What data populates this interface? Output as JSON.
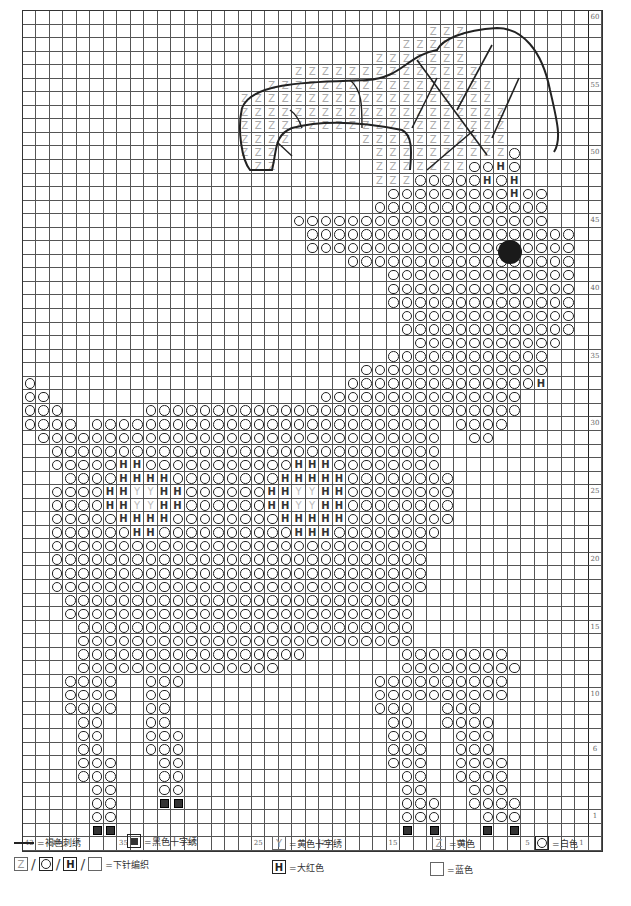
{
  "chart_data": {
    "type": "knitting-chart",
    "title": "",
    "columns": 43,
    "rows": 60,
    "column_labels": {
      "0": "42",
      "2": "40",
      "7": "35",
      "12": "30",
      "17": "25",
      "22": "20",
      "27": "15",
      "32": "10",
      "37": "5",
      "41": "1"
    },
    "row_labels": {
      "60": "60",
      "55": "55",
      "50": "50",
      "45": "45",
      "40": "40",
      "35": "35",
      "30": "30",
      "25": "25",
      "20": "20",
      "15": "15",
      "10": "10",
      "6": "6",
      "1": "1"
    },
    "symbols": {
      "O": "white",
      "H": "bright red",
      "Y": "yellow cross-stitch",
      "Z": "yellow",
      "X": "black cross-stitch",
      ".": "blue (background)"
    },
    "grid_top_to_bottom": [
      "...........................................",
      "..............................ZZZ..........",
      "............................ZZZZZ..........",
      "..........................ZZZZZZZ..........",
      "....................ZZZZZZZZZZZZZZ.........",
      "..................ZZZZZZZZZZZZZZZZZ........",
      "................ZZZZZZZZZZZZZZZZZZZ........",
      "................ZZZZZZZZZZZZZZZZZZZZ.......",
      "................ZZZZZZZZZZZZZZZZZZZZ.......",
      "................ZZZZ.....ZZZZZZZZZZZ.......",
      "................ZZZ.......ZZZZZZZZZZO......",
      ".................ZZ.......ZZZZZZZOOHO......",
      "..........................ZZZOOOOOHOH......",
      "...........................OOOOOOOOOHOO....",
      "..........................OOOOOOOOOOOOO....",
      "....................OOOOOOOOOOOOOOOOOOO....",
      ".....................OOOOOOOOOOOOOOOOOOOO..",
      ".....................OOOOOOOOOOOOOOOOOOOO..",
      "........................OOOOOOOOOOOOOOOOO..",
      "...........................OOOOOOOOOOOOOO..",
      "...........................OOOOOOOOOOOOOO..",
      "...........................OOOOOOOOOOOOOO..",
      "............................OOOOOOOOOOOOO..",
      "............................OOOOOOOOOOOOO..",
      ".............................OOOOOOOOOOO...",
      "...........................OOOOOOOOOOOO....",
      ".........................OOOOOOOOOOOOOO....",
      "O.......................OOOOOOOOOOOOOOH....",
      "OO....................OOOOOOOOOOOOOOO......",
      "OOO......OOOOOOOOOOOOOOOOOOOOOOOOOOOO......",
      "OOOO.OOOOOOOOOOOOOOOOOOOOOOOOOO.OOOO.......",
      ".OOOOOOOOOOOOOOOOOOOOOOOOOOOOOO..OO........",
      "..OOOOOOOOOOOOOOOOOOOOOOOOOOOOO............",
      "..OOOOOHHOOOOOOOOOOOHHHOOOOOOOO............",
      "...OOOOHHHHOOOOOOOOHHHHHOOOOOOOO...........",
      "..OOOOHHYYHHOOOOOOHHYYHHOOOOOOOO...........",
      "..OOOOHHYYHHOOOOOOHHYYHHOOOOOOOO...........",
      "..OOOOOHHHHOOOOOOOOHHHHHOOOOOOOO...........",
      "..OOOOOOHHOOOOOOOOOOHHHOOOOOOOO............",
      "..OOOOOOOOOOOOOOOOOOOOOOOOOOOO.............",
      "..OOOOOOOOOOOOOOOOOOOOOOOOOOOO.............",
      "..OOOOOOOOOOOOOOOOOOOOOOOOOOOO.............",
      "..OOOOOOOOOOOOOOOOOOOOOOOOOOOO.............",
      "...OOOOOOOOOOOOOOOOOOOOOOOOOO..............",
      "...OOOOOOOOOOOOOOOOOOOOOOOOOO..............",
      "....OOOOOOOOOOOOOOOOOOOOOOOOO..............",
      "....OOOOOOOOOOOOOOOOOOOOOOOOO..............",
      "....OOOOOOOOOOOOOOOOO.......OOOOOOOO.......",
      "....OOOOOOOOOOOOOOO.........OOOOOOOOO......",
      "...OOOO..OOO..............OOOOOOOOOO.......",
      "...OOOO..OO...............OOOOOOOOOO.......",
      "...OOOO..OO...............OOO..OOO.........",
      "....OO...OO................OO..OOOO........",
      "....OO...OOO...............OOO..OOO........",
      "....OO...OOO...............OOO..OOO........",
      "....OOO...OO...............OOO..OOOO.......",
      "....OOO...OO................OO..OOOO.......",
      ".....OO...OO................OO...OOO.......",
      ".....OO...XX................OOO..OOOO......",
      ".....OO.....................OOO...OOO......",
      ".....XX.....................X.X...X.X......"
    ]
  },
  "legend": {
    "row1": [
      {
        "symbol": "line",
        "label": "=褐色刺绣"
      },
      {
        "symbol": "X",
        "label": "=黑色十字绣"
      },
      {
        "symbol": "Y",
        "label": "=黄色十字绣"
      },
      {
        "symbol": "Z",
        "label": "=黄色"
      },
      {
        "symbol": "O",
        "label": "=白色"
      }
    ],
    "row2": {
      "combo_symbols": [
        "Z",
        "O",
        "H",
        ""
      ],
      "combo_label": "=下针编织",
      "h_label": "=大红色",
      "blank_label": "=蓝色"
    }
  },
  "nose_dot": {
    "color": "#1a1a1a"
  }
}
